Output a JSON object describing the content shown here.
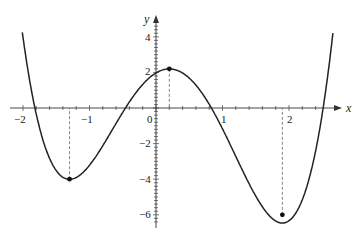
{
  "chart_data": {
    "type": "line",
    "title": "",
    "xlabel": "x",
    "ylabel": "y",
    "xlim": [
      -2.1,
      2.6
    ],
    "ylim": [
      -6.5,
      4.8
    ],
    "x_ticks": [
      "-2",
      "-1",
      "0",
      "1",
      "2"
    ],
    "y_ticks": [
      "4",
      "2",
      "-2",
      "-4",
      "-6"
    ],
    "grid": false,
    "legend": null,
    "series": [
      {
        "name": "f(x)",
        "description": "quartic polynomial with local minima near x=-1.3 and x=1.9 and local maximum near x=0.2",
        "x": [
          -2.0,
          -1.85,
          -1.3,
          -0.5,
          0.0,
          0.2,
          0.9,
          1.9,
          2.47,
          2.6
        ],
        "y": [
          4.3,
          0.0,
          -4.0,
          0.0,
          2.0,
          2.2,
          0.0,
          -6.0,
          0.0,
          4.3
        ]
      }
    ],
    "marked_points": [
      {
        "x": -1.3,
        "y": -4.0,
        "label": "local minimum"
      },
      {
        "x": 0.2,
        "y": 2.2,
        "label": "local maximum"
      },
      {
        "x": 1.9,
        "y": -6.0,
        "label": "local minimum"
      }
    ],
    "annotations": [
      "dashed vertical lines from each marked point to the x-axis"
    ]
  },
  "axes": {
    "x_label": "x",
    "y_label": "y",
    "x_tick_labels": [
      "−2",
      "−1",
      "0",
      "1",
      "2"
    ],
    "y_tick_labels": [
      "4",
      "2",
      "−2",
      "−4",
      "−6"
    ]
  }
}
